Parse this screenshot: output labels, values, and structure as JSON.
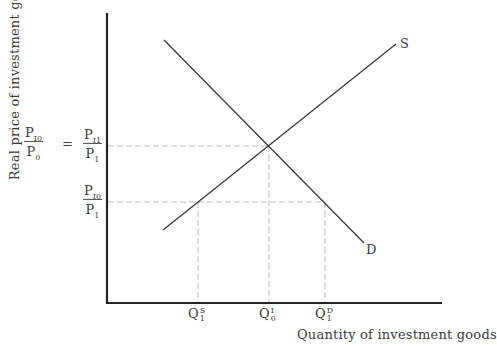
{
  "diagram": {
    "title": "",
    "y_axis_label": "Real price of investment goods",
    "x_axis_label": "Quantity of investment goods",
    "left_ratio": {
      "numerator_base": "P",
      "numerator_sub": "I0",
      "denominator_base": "P",
      "denominator_sub": "0"
    },
    "equals_sign": "=",
    "price_levels": [
      {
        "id": "upper",
        "numerator_base": "P",
        "numerator_sub": "I1",
        "denominator_base": "P",
        "denominator_sub": "1"
      },
      {
        "id": "lower",
        "numerator_base": "P",
        "numerator_sub": "I0",
        "denominator_base": "P",
        "denominator_sub": "1"
      }
    ],
    "curves": [
      {
        "id": "supply",
        "label": "S"
      },
      {
        "id": "demand",
        "label": "D"
      }
    ],
    "quantity_levels": [
      {
        "id": "qs1",
        "base": "Q",
        "sup": "S",
        "sub": "1"
      },
      {
        "id": "qi0",
        "base": "Q",
        "sup": "I",
        "sub": "0"
      },
      {
        "id": "qd1",
        "base": "Q",
        "sup": "D",
        "sub": "1"
      }
    ],
    "colors": {
      "axis": "#222222",
      "curve": "#333333",
      "guide": "#aaaaaa",
      "text": "#3a3a3a"
    }
  }
}
